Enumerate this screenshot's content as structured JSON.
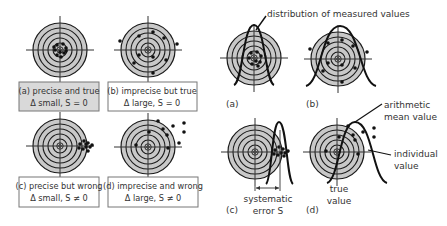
{
  "colors": {
    "target_fill": "#c8c8c8",
    "ring_stroke": "#1a1a1a",
    "crosshair": "#333333",
    "dot": "#111111",
    "curve": "#111111",
    "box_gray": "#d9d9d9",
    "box_white": "#ffffff",
    "box_border": "#777777",
    "text": "#333333"
  },
  "left_panel": {
    "targets": [
      {
        "id": "a",
        "cx": 60,
        "cy": 50,
        "box": {
          "x": 19,
          "y": 82,
          "w": 80,
          "h": 29,
          "fill": "gray"
        },
        "caption_line1": "(a) precise and true",
        "caption_line2": "Δ small, S = 0",
        "dots": [
          [
            57,
            45
          ],
          [
            63,
            44
          ],
          [
            66,
            48
          ],
          [
            55,
            50
          ],
          [
            60,
            52
          ],
          [
            64,
            53
          ],
          [
            57,
            55
          ],
          [
            61,
            57
          ],
          [
            54,
            47
          ],
          [
            66,
            51
          ]
        ]
      },
      {
        "id": "b",
        "cx": 148,
        "cy": 50,
        "box": {
          "x": 108,
          "y": 82,
          "w": 89,
          "h": 29,
          "fill": "white"
        },
        "caption_line1": "(b) imprecise but true",
        "caption_line2": "Δ large, S = 0",
        "dots": [
          [
            120,
            41
          ],
          [
            139,
            36
          ],
          [
            153,
            32
          ],
          [
            164,
            38
          ],
          [
            177,
            44
          ],
          [
            139,
            55
          ],
          [
            153,
            57
          ],
          [
            166,
            60
          ],
          [
            134,
            63
          ],
          [
            153,
            73
          ]
        ]
      },
      {
        "id": "c",
        "cx": 60,
        "cy": 146,
        "box": {
          "x": 19,
          "y": 177,
          "w": 80,
          "h": 30,
          "fill": "white"
        },
        "caption_line1": "(c) precise but wrong",
        "caption_line2": "Δ small, S ≠ 0",
        "dots": [
          [
            80,
            144
          ],
          [
            84,
            141
          ],
          [
            88,
            143
          ],
          [
            86,
            147
          ],
          [
            90,
            147
          ],
          [
            83,
            149
          ],
          [
            88,
            151
          ],
          [
            79,
            148
          ],
          [
            86,
            144
          ],
          [
            92,
            145
          ]
        ]
      },
      {
        "id": "d",
        "cx": 148,
        "cy": 147,
        "box": {
          "x": 108,
          "y": 177,
          "w": 90,
          "h": 30,
          "fill": "white"
        },
        "caption_line1": "(d) imprecise and wrong",
        "caption_line2": "Δ large, S ≠ 0",
        "dots": [
          [
            158,
            121
          ],
          [
            163,
            129
          ],
          [
            173,
            126
          ],
          [
            184,
            123
          ],
          [
            184,
            132
          ],
          [
            149,
            132
          ],
          [
            167,
            135
          ],
          [
            179,
            143
          ],
          [
            136,
            145
          ],
          [
            168,
            148
          ]
        ]
      }
    ]
  },
  "right_panel": {
    "title_annotation": "distribution of measured values",
    "panels": [
      {
        "id": "a",
        "label": "(a)",
        "cx": 254,
        "cy": 58,
        "dots": [
          [
            251,
            53
          ],
          [
            257,
            52
          ],
          [
            261,
            56
          ],
          [
            249,
            58
          ],
          [
            256,
            61
          ],
          [
            260,
            62
          ],
          [
            252,
            64
          ],
          [
            258,
            66
          ]
        ],
        "curve": {
          "peak_x": 254,
          "peak_y": 25,
          "base_y": 85,
          "left_x": 234,
          "right_x": 274
        }
      },
      {
        "id": "b",
        "label": "(b)",
        "cx": 338,
        "cy": 59,
        "dots": [
          [
            310,
            49
          ],
          [
            328,
            43
          ],
          [
            342,
            40
          ],
          [
            353,
            46
          ],
          [
            367,
            52
          ],
          [
            328,
            63
          ],
          [
            342,
            65
          ],
          [
            355,
            68
          ],
          [
            323,
            71
          ],
          [
            342,
            82
          ]
        ],
        "curve": {
          "peak_x": 340,
          "peak_y": 26,
          "base_y": 86,
          "left_x": 306,
          "right_x": 376
        }
      },
      {
        "id": "c",
        "label": "(c)",
        "cx": 255,
        "cy": 152,
        "dots": [
          [
            275,
            150
          ],
          [
            279,
            147
          ],
          [
            283,
            149
          ],
          [
            281,
            153
          ],
          [
            285,
            153
          ],
          [
            278,
            155
          ],
          [
            284,
            156
          ],
          [
            274,
            154
          ],
          [
            288,
            151
          ]
        ],
        "curve": {
          "peak_x": 279,
          "peak_y": 122,
          "base_y": 184,
          "left_x": 266,
          "right_x": 293
        },
        "systematic_error_label_line1": "systematic",
        "systematic_error_label_line2": "error S"
      },
      {
        "id": "d",
        "label": "(d)",
        "cx": 337,
        "cy": 152,
        "dots": [
          [
            348,
            126
          ],
          [
            363,
            132
          ],
          [
            374,
            128
          ],
          [
            374,
            137
          ],
          [
            339,
            137
          ],
          [
            353,
            135
          ],
          [
            355,
            140
          ],
          [
            326,
            151
          ],
          [
            358,
            154
          ]
        ],
        "curve": {
          "peak_x": 355,
          "peak_y": 122,
          "base_y": 183,
          "left_x": 327,
          "right_x": 387
        },
        "arithmetic_label_line1": "arithmetic",
        "arithmetic_label_line2": "mean value",
        "individual_label_line1": "individual",
        "individual_label_line2": "value",
        "true_label_line1": "true",
        "true_label_line2": "value"
      }
    ]
  }
}
